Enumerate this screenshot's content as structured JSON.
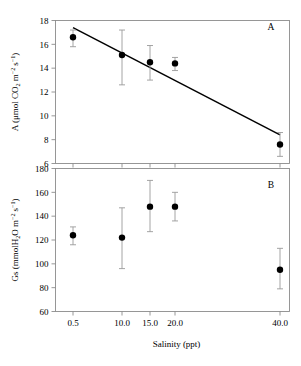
{
  "figure": {
    "xaxis_title": "Salinity (ppt)",
    "panel_a_label": "A",
    "panel_b_label": "B"
  },
  "chart_data": [
    {
      "type": "scatter",
      "panel": "A",
      "title": "",
      "xlabel": "Salinity (ppt)",
      "ylabel": "A (μmol CO2 m-2 s-1)",
      "ylabel_parts": {
        "pre": "A (μmol CO",
        "sub1": "2",
        "mid": " m",
        "sup1": "-2",
        "mid2": "s",
        "sup2": "-1",
        "post": ")"
      },
      "x": [
        0.5,
        10.0,
        15.0,
        20.0,
        40.0
      ],
      "xticklabels": [
        "0.5",
        "10.0",
        "15.0",
        "20.0",
        "40.0"
      ],
      "values": [
        16.6,
        15.1,
        14.5,
        14.4,
        7.6
      ],
      "error_upper": [
        17.2,
        17.2,
        15.9,
        14.9,
        8.6
      ],
      "error_lower": [
        15.8,
        12.6,
        13.0,
        13.8,
        6.6
      ],
      "yticklabels": [
        "18",
        "16",
        "14",
        "12",
        "10",
        "8",
        "6"
      ],
      "yticks": [
        18,
        16,
        14,
        12,
        10,
        8,
        6
      ],
      "ylim": [
        6,
        18
      ],
      "xlim": [
        0,
        44
      ],
      "grid": false,
      "legend": "none",
      "trendline": {
        "x_start": 0.5,
        "y_start": 17.4,
        "x_end": 40.0,
        "y_end": 8.4
      },
      "marker": "filled-circle",
      "marker_color": "#000000",
      "errorbar_color": "#9a9a9a",
      "line_color": "#000000"
    },
    {
      "type": "scatter",
      "panel": "B",
      "title": "",
      "xlabel": "Salinity (ppt)",
      "ylabel": "Gs (mmolH2O m-2 s-1)",
      "ylabel_parts": {
        "pre": "Gs (mmolH",
        "sub1": "2",
        "mid": "O m",
        "sup1": "-2",
        "mid2": "s",
        "sup2": "-1",
        "post": ")"
      },
      "x": [
        0.5,
        10.0,
        15.0,
        20.0,
        40.0
      ],
      "xticklabels": [
        "0.5",
        "10.0",
        "15.0",
        "20.0",
        "40.0"
      ],
      "values": [
        124,
        122,
        148,
        148,
        95
      ],
      "error_upper": [
        131,
        147,
        170,
        160,
        113
      ],
      "error_lower": [
        116,
        96,
        127,
        136,
        79
      ],
      "yticklabels": [
        "180",
        "160",
        "140",
        "120",
        "100",
        "80",
        "60"
      ],
      "yticks": [
        180,
        160,
        140,
        120,
        100,
        80,
        60
      ],
      "ylim": [
        60,
        180
      ],
      "xlim": [
        0,
        44
      ],
      "grid": false,
      "legend": "none",
      "marker": "filled-circle",
      "marker_color": "#000000",
      "errorbar_color": "#9a9a9a"
    }
  ]
}
